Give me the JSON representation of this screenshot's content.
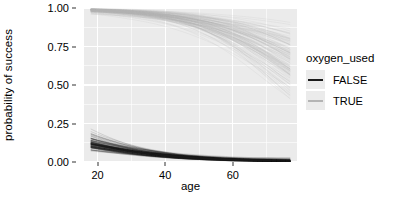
{
  "chart_data": {
    "type": "line",
    "title": "",
    "xlabel": "age",
    "ylabel": "probability of success",
    "xlim": [
      16,
      79
    ],
    "ylim": [
      0.0,
      1.0
    ],
    "grid": true,
    "x_ticks": [
      {
        "value": 20,
        "label": "20"
      },
      {
        "value": 40,
        "label": "40"
      },
      {
        "value": 60,
        "label": "60"
      }
    ],
    "x_minor_ticks": [
      30,
      50,
      70
    ],
    "y_ticks": [
      {
        "value": 0.0,
        "label": "0.00"
      },
      {
        "value": 0.25,
        "label": "0.25"
      },
      {
        "value": 0.5,
        "label": "0.50"
      },
      {
        "value": 0.75,
        "label": "0.75"
      },
      {
        "value": 1.0,
        "label": "1.00"
      }
    ],
    "y_minor_ticks": [
      0.125,
      0.375,
      0.625,
      0.875
    ],
    "legend": {
      "title": "oxygen_used",
      "position": "right",
      "entries": [
        {
          "label": "FALSE",
          "color": "#1A1A1A"
        },
        {
          "label": "TRUE",
          "color": "#B4B4B4"
        }
      ]
    },
    "n_draws_per_group": 120,
    "series": [
      {
        "name": "FALSE",
        "color": "#1A1A1A",
        "kind": "posterior-draw-band",
        "x": [
          18,
          25,
          30,
          35,
          40,
          45,
          50,
          55,
          60,
          65,
          70,
          77
        ],
        "median": [
          0.118,
          0.088,
          0.07,
          0.055,
          0.043,
          0.033,
          0.026,
          0.02,
          0.015,
          0.012,
          0.009,
          0.006
        ],
        "lower": [
          0.062,
          0.046,
          0.036,
          0.027,
          0.02,
          0.015,
          0.011,
          0.008,
          0.005,
          0.004,
          0.002,
          0.001
        ],
        "upper": [
          0.186,
          0.146,
          0.12,
          0.098,
          0.079,
          0.063,
          0.05,
          0.04,
          0.031,
          0.025,
          0.019,
          0.014
        ]
      },
      {
        "name": "TRUE",
        "color": "#B4B4B4",
        "kind": "posterior-draw-band",
        "x": [
          18,
          25,
          30,
          35,
          40,
          45,
          50,
          55,
          60,
          65,
          70,
          77
        ],
        "median": [
          0.988,
          0.981,
          0.974,
          0.965,
          0.953,
          0.937,
          0.916,
          0.889,
          0.855,
          0.813,
          0.763,
          0.682
        ],
        "lower": [
          0.968,
          0.951,
          0.935,
          0.915,
          0.889,
          0.857,
          0.817,
          0.769,
          0.712,
          0.648,
          0.578,
          0.48
        ],
        "upper": [
          0.997,
          0.995,
          0.993,
          0.99,
          0.986,
          0.981,
          0.974,
          0.964,
          0.951,
          0.934,
          0.911,
          0.868
        ]
      }
    ]
  },
  "axes": {
    "y_title": "probability of success",
    "x_title": "age"
  },
  "theme": {
    "panel_background": "#EBEBEB",
    "gridline_color": "#FFFFFF",
    "plot_background": "#FFFFFF",
    "text_color": "#000000",
    "false_color": "#1A1A1A",
    "true_color": "#B4B4B4"
  }
}
